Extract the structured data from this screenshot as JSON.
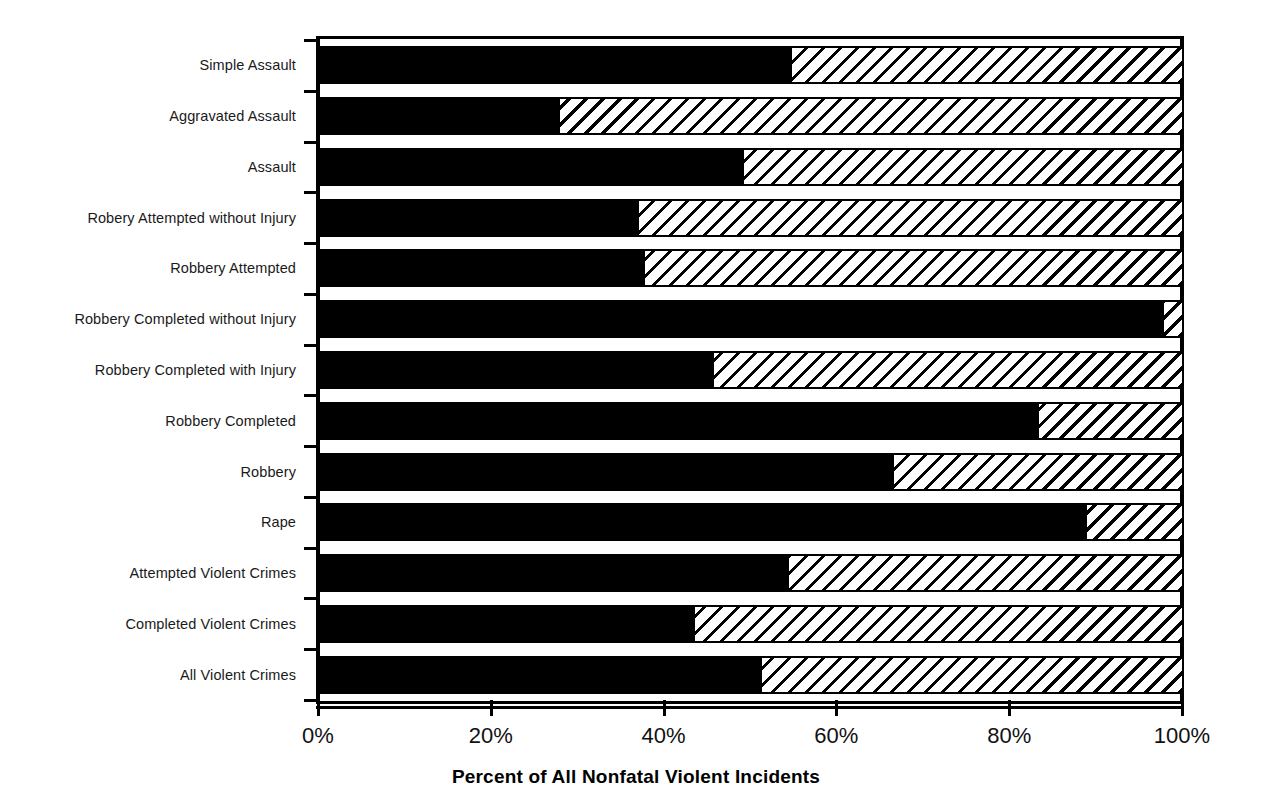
{
  "chart_data": {
    "type": "bar",
    "orientation": "horizontal",
    "stacked": true,
    "title": "",
    "xlabel": "Percent of All Nonfatal Violent Incidents",
    "ylabel": "",
    "xlim": [
      0,
      100
    ],
    "xticks": [
      0,
      20,
      40,
      60,
      80,
      100
    ],
    "xtick_labels": [
      "0%",
      "20%",
      "40%",
      "60%",
      "80%",
      "100%"
    ],
    "grid": false,
    "legend": "none",
    "categories": [
      "Simple Assault",
      "Aggravated Assault",
      "Assault",
      "Robery Attempted without Injury",
      "Robbery Attempted",
      "Robbery Completed without Injury",
      "Robbery Completed with Injury",
      "Robbery Completed",
      "Robbery",
      "Rape",
      "Attempted Violent Crimes",
      "Completed Violent Crimes",
      "All Violent Crimes"
    ],
    "series": [
      {
        "name": "solid-black-segment",
        "fill": "solid-black",
        "values": [
          54.6,
          27.8,
          49.1,
          36.9,
          37.6,
          97.7,
          45.6,
          83.2,
          66.4,
          88.8,
          54.3,
          43.4,
          51.2
        ]
      },
      {
        "name": "hatched-segment",
        "fill": "diagonal-hatch",
        "values": [
          45.4,
          72.2,
          50.9,
          63.1,
          62.4,
          2.3,
          54.4,
          16.8,
          33.6,
          11.2,
          45.7,
          56.6,
          48.8
        ]
      }
    ],
    "colors": {
      "solid": "#000000",
      "hatch_line": "#000000",
      "hatch_background": "#ffffff",
      "axis": "#000000",
      "background": "#ffffff"
    }
  }
}
